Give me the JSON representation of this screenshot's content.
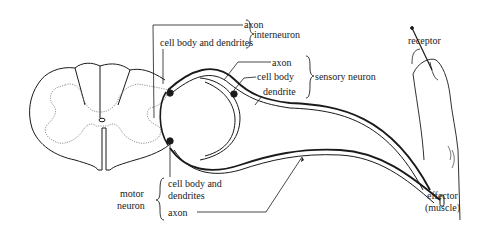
{
  "labels": {
    "interneuron_axon": "axon",
    "interneuron_cell_body": "cell body and dendrites",
    "interneuron": "interneuron",
    "sensory_axon": "axon",
    "sensory_cell_body": "cell body",
    "sensory_dendrite": "dendrite",
    "sensory_neuron": "sensory neuron",
    "receptor": "receptor",
    "motor_cell_body_line1": "cell body and",
    "motor_cell_body_line2": "dendrites",
    "motor_axon": "axon",
    "motor_neuron_line1": "motor",
    "motor_neuron_line2": "neuron",
    "effector_line1": "effector",
    "effector_line2": "(muscle)"
  },
  "colors": {
    "ink": "#1a1a1a",
    "background": "#ffffff",
    "gray_matter_outline": "#777777"
  }
}
